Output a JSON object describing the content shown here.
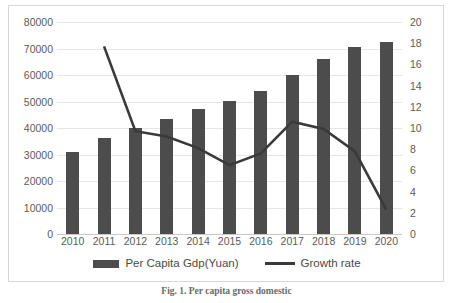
{
  "figure": {
    "caption": "Fig. 1.  Per capita gross domestic",
    "border_color": "#d8d8d8"
  },
  "legend": {
    "position": "bottom-center",
    "entries": [
      {
        "label": "Per Capita Gdp(Yuan)",
        "marker": "bar-swatch",
        "color": "#4c4c4c"
      },
      {
        "label": "Growth rate",
        "marker": "line-swatch",
        "color": "#3a3a3a"
      }
    ]
  },
  "chart_data": {
    "type": "bar",
    "title": "",
    "subtitle": "",
    "xlabel": "",
    "ylabel": "",
    "grid": true,
    "legend_position": "bottom",
    "categories": [
      "2010",
      "2011",
      "2012",
      "2013",
      "2014",
      "2015",
      "2016",
      "2017",
      "2018",
      "2019",
      "2020"
    ],
    "axes": {
      "left": {
        "label": "",
        "ylim": [
          0,
          80000
        ],
        "ticks": [
          0,
          10000,
          20000,
          30000,
          40000,
          50000,
          60000,
          70000,
          80000
        ],
        "tick_labels": [
          "0",
          "10000",
          "20000",
          "30000",
          "40000",
          "50000",
          "60000",
          "70000",
          "80000"
        ]
      },
      "right": {
        "label": "",
        "ylim": [
          0,
          20
        ],
        "ticks": [
          0,
          2,
          4,
          6,
          8,
          10,
          12,
          14,
          16,
          18,
          20
        ],
        "tick_labels": [
          "0",
          "2",
          "4",
          "6",
          "8",
          "10",
          "12",
          "14",
          "16",
          "18",
          "20"
        ]
      },
      "x": {
        "tick_labels": [
          "2010",
          "2011",
          "2012",
          "2013",
          "2014",
          "2015",
          "2016",
          "2017",
          "2018",
          "2019",
          "2020"
        ]
      }
    },
    "series": [
      {
        "name": "Per Capita Gdp(Yuan)",
        "type": "bar",
        "axis": "left",
        "color": "#4c4c4c",
        "values": [
          30800,
          36100,
          39900,
          43500,
          47000,
          50200,
          54000,
          59900,
          65900,
          70700,
          72400
        ]
      },
      {
        "name": "Growth rate",
        "type": "line",
        "axis": "right",
        "color": "#3a3a3a",
        "values": [
          null,
          17.7,
          9.7,
          9.2,
          8.1,
          6.5,
          7.6,
          10.6,
          9.9,
          7.8,
          2.3
        ]
      }
    ]
  }
}
